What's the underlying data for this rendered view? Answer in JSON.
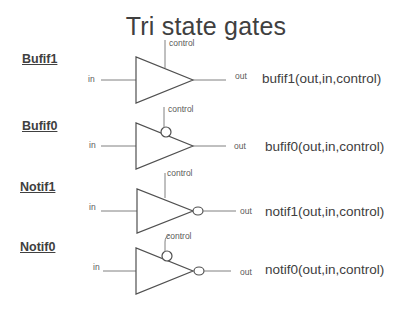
{
  "title": "Tri state gates",
  "gates": [
    {
      "name": "Bufif1",
      "input_label": "in",
      "control_label": "control",
      "output_label": "out",
      "syntax": "bufif1(out,in,control)",
      "control_active_low": false,
      "output_inverted": false
    },
    {
      "name": "Bufif0",
      "input_label": "in",
      "control_label": "control",
      "output_label": "out",
      "syntax": "bufif0(out,in,control)",
      "control_active_low": true,
      "output_inverted": false
    },
    {
      "name": "Notif1",
      "input_label": "in",
      "control_label": "control",
      "output_label": "out",
      "syntax": "notif1(out,in,control)",
      "control_active_low": false,
      "output_inverted": true
    },
    {
      "name": "Notif0",
      "input_label": "in",
      "control_label": "control",
      "output_label": "out",
      "syntax": "notif0(out,in,control)",
      "control_active_low": true,
      "output_inverted": true
    }
  ],
  "colors": {
    "text": "#404040",
    "wire": "#808080",
    "gate_outline": "#505050",
    "background": "#ffffff"
  }
}
